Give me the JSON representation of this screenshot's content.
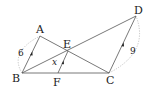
{
  "diagram": {
    "points": {
      "A": {
        "label": "A",
        "x": 40,
        "y": 36
      },
      "B": {
        "label": "B",
        "x": 22,
        "y": 73
      },
      "C": {
        "label": "C",
        "x": 109,
        "y": 73
      },
      "D": {
        "label": "D",
        "x": 136,
        "y": 16
      },
      "E": {
        "label": "E",
        "x": 68,
        "y": 51
      },
      "F": {
        "label": "F",
        "x": 58,
        "y": 73
      }
    },
    "segments": [
      "AB",
      "AC",
      "BD",
      "BC",
      "CD",
      "EF"
    ],
    "parallel_marks": [
      "AB",
      "EF",
      "CD"
    ],
    "measures": {
      "AB": "6",
      "CD": "9",
      "EF": "x"
    }
  }
}
